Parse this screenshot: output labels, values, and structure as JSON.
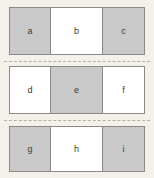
{
  "diagram": {
    "type": "grid-of-labeled-cells",
    "background_color": "#f4f1ea",
    "shaded_color": "#c9c9c9",
    "unshaded_color": "#ffffff",
    "border_color": "#8a8a8a",
    "separator_color": "#b5b0a6",
    "separator_style": "dashed",
    "rows": [
      {
        "name": "row-1",
        "cells": [
          {
            "label": "a",
            "shaded": true
          },
          {
            "label": "b",
            "shaded": false
          },
          {
            "label": "c",
            "shaded": true
          }
        ]
      },
      {
        "name": "row-2",
        "cells": [
          {
            "label": "d",
            "shaded": false
          },
          {
            "label": "e",
            "shaded": true
          },
          {
            "label": "f",
            "shaded": false
          }
        ]
      },
      {
        "name": "row-3",
        "cells": [
          {
            "label": "g",
            "shaded": true
          },
          {
            "label": "h",
            "shaded": false
          },
          {
            "label": "i",
            "shaded": true
          }
        ]
      }
    ],
    "separators": [
      {
        "name": "separator-1"
      },
      {
        "name": "separator-2"
      }
    ]
  }
}
